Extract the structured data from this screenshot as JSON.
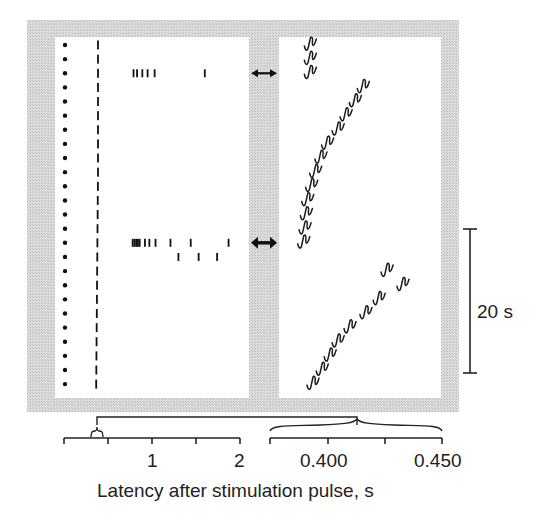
{
  "chart_data": {
    "type": "scatter",
    "subtype": "raster-plot",
    "title": "",
    "xlabel": "Latency after stimulation pulse, s",
    "scale_bar": {
      "label": "20 s",
      "orientation": "vertical"
    },
    "n_trials": 25,
    "colors": {
      "background_frame": "#d4d4d4",
      "panel": "#ffffff",
      "ink": "#111111"
    },
    "panels": [
      {
        "name": "full-latency-raster",
        "xlim": [
          0,
          2
        ],
        "ticks": [
          0,
          0.5,
          1,
          1.5,
          2
        ],
        "tick_labels": [
          "",
          "",
          "1",
          "",
          "2"
        ],
        "stim_marker_column": "dots at each trial row",
        "first_response_latency_s": 0.4,
        "extra_spike_trials": [
          {
            "trial": 3,
            "latencies_s": [
              0.79,
              0.83,
              0.89,
              0.95,
              1.03,
              1.6
            ]
          },
          {
            "trial": 15,
            "latencies_s": [
              0.78,
              0.8,
              0.82,
              0.84,
              0.86,
              0.92,
              0.97,
              1.04,
              1.21,
              1.44,
              1.87
            ]
          },
          {
            "trial": 16,
            "latencies_s": [
              1.3,
              1.53,
              1.74
            ]
          }
        ],
        "arrows_at_trials": [
          3,
          15
        ]
      },
      {
        "name": "zoomed-first-spike-latency",
        "xlim": [
          0.385,
          0.45
        ],
        "ticks": [
          0.385,
          0.4,
          0.425,
          0.45
        ],
        "tick_labels": [
          "",
          "0.400",
          "",
          "0.450"
        ],
        "series": [
          {
            "name": "trials 1-3",
            "trials": [
              1,
              2,
              3
            ],
            "latency_s": [
              0.3995,
              0.3995,
              0.3995
            ]
          },
          {
            "name": "trials 4-15",
            "trials": [
              4,
              5,
              6,
              7,
              8,
              9,
              10,
              11,
              12,
              13,
              14,
              15
            ],
            "latency_s": [
              0.4195,
              0.4165,
              0.413,
              0.41,
              0.406,
              0.4035,
              0.4015,
              0.4,
              0.3985,
              0.398,
              0.3975,
              0.397
            ]
          },
          {
            "name": "trials 16-25",
            "trials": [
              17,
              18,
              19,
              20,
              21,
              22,
              23,
              24,
              25
            ],
            "latency_s": [
              0.4285,
              0.4345,
              0.4255,
              0.4205,
              0.4145,
              0.41,
              0.407,
              0.404,
              0.4005
            ]
          }
        ]
      }
    ]
  },
  "labels": {
    "left_tick_1": "1",
    "left_tick_2": "2",
    "right_tick_400": "0.400",
    "right_tick_450": "0.450",
    "x_axis_title": "Latency after stimulation pulse, s",
    "scale_bar_label": "20 s"
  }
}
